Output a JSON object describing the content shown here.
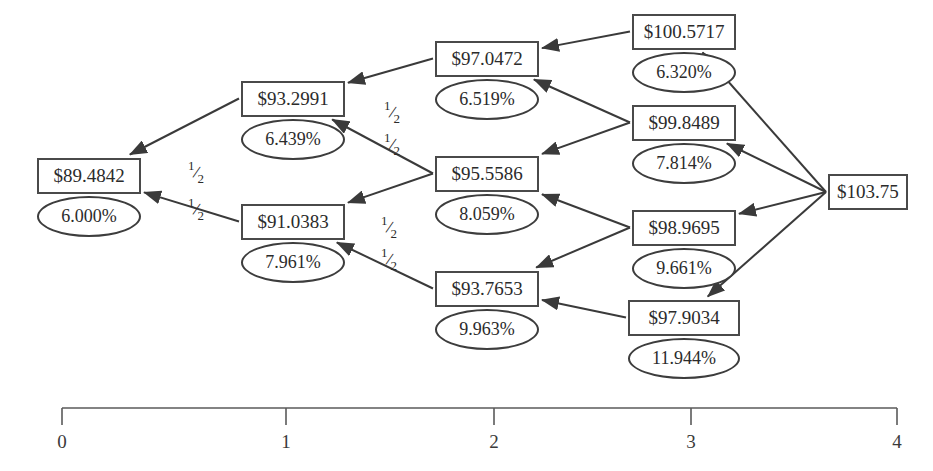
{
  "diagram": {
    "type": "binomial-interest-rate-tree",
    "root": {
      "id": "n4",
      "price": "$103.75",
      "rate": null,
      "step": 4,
      "x": 868,
      "y": 192
    },
    "nodes": [
      {
        "id": "n0a",
        "price": "$89.4842",
        "rate": "6.000%",
        "step": 0,
        "x": 89,
        "y": 197
      },
      {
        "id": "n1a",
        "price": "$93.2991",
        "rate": "6.439%",
        "step": 1,
        "x": 293,
        "y": 120
      },
      {
        "id": "n1b",
        "price": "$91.0383",
        "rate": "7.961%",
        "step": 1,
        "x": 293,
        "y": 243
      },
      {
        "id": "n2a",
        "price": "$97.0472",
        "rate": "6.519%",
        "step": 2,
        "x": 487,
        "y": 80
      },
      {
        "id": "n2b",
        "price": "$95.5586",
        "rate": "8.059%",
        "step": 2,
        "x": 487,
        "y": 195
      },
      {
        "id": "n2c",
        "price": "$93.7653",
        "rate": "9.963%",
        "step": 2,
        "x": 487,
        "y": 310
      },
      {
        "id": "n3a",
        "price": "$100.5717",
        "rate": "6.320%",
        "step": 3,
        "x": 684,
        "y": 53
      },
      {
        "id": "n3b",
        "price": "$99.8489",
        "rate": "7.814%",
        "step": 3,
        "x": 684,
        "y": 144
      },
      {
        "id": "n3c",
        "price": "$98.9695",
        "rate": "9.661%",
        "step": 3,
        "x": 684,
        "y": 249
      },
      {
        "id": "n3d",
        "price": "$97.9034",
        "rate": "11.944%",
        "step": 3,
        "x": 684,
        "y": 339
      }
    ],
    "edges": [
      {
        "from": "n4",
        "to": "n3a"
      },
      {
        "from": "n4",
        "to": "n3b"
      },
      {
        "from": "n4",
        "to": "n3c"
      },
      {
        "from": "n4",
        "to": "n3d"
      },
      {
        "from": "n3a",
        "to": "n2a"
      },
      {
        "from": "n3b",
        "to": "n2a"
      },
      {
        "from": "n3b",
        "to": "n2b"
      },
      {
        "from": "n3c",
        "to": "n2b"
      },
      {
        "from": "n3c",
        "to": "n2c"
      },
      {
        "from": "n3d",
        "to": "n2c"
      },
      {
        "from": "n2a",
        "to": "n1a"
      },
      {
        "from": "n2b",
        "to": "n1a"
      },
      {
        "from": "n2b",
        "to": "n1b"
      },
      {
        "from": "n2c",
        "to": "n1b"
      },
      {
        "from": "n1a",
        "to": "n0a"
      },
      {
        "from": "n1b",
        "to": "n0a"
      }
    ],
    "probability_labels": [
      {
        "id": "p1",
        "numerator": "1",
        "denominator": "2",
        "x": 196,
        "y": 172
      },
      {
        "id": "p2",
        "numerator": "1",
        "denominator": "2",
        "x": 196,
        "y": 209
      },
      {
        "id": "p3",
        "numerator": "1",
        "denominator": "2",
        "x": 392,
        "y": 112
      },
      {
        "id": "p4",
        "numerator": "1",
        "denominator": "2",
        "x": 392,
        "y": 144
      },
      {
        "id": "p5",
        "numerator": "1",
        "denominator": "2",
        "x": 389,
        "y": 227
      },
      {
        "id": "p6",
        "numerator": "1",
        "denominator": "2",
        "x": 389,
        "y": 259
      }
    ]
  },
  "axis": {
    "y": 408,
    "x_start": 62,
    "x_end": 897,
    "tick_height": 17,
    "label_y": 432,
    "ticks": [
      {
        "label": "0",
        "x": 62
      },
      {
        "label": "1",
        "x": 286
      },
      {
        "label": "2",
        "x": 494
      },
      {
        "label": "3",
        "x": 691
      },
      {
        "label": "4",
        "x": 897
      }
    ]
  },
  "style": {
    "edge_color": "#3a3a3a",
    "box_border_color": "#4a4a4a",
    "oval_border_color": "#3d3d3d",
    "text_color": "#2b2b2b",
    "axis_color": "#5a5a5a",
    "background": "#ffffff"
  }
}
